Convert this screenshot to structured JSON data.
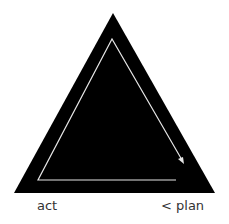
{
  "diagram": {
    "type": "cycle-triangle",
    "colors": {
      "background": "#ffffff",
      "triangle_fill": "#000000",
      "cycle_line": "#e6e6e6",
      "side_label": "#ffffff",
      "corner_label": "#333333"
    },
    "side_labels": {
      "left": "consequences",
      "right": "reappraisal"
    },
    "corner_labels": {
      "bottom_left": "act",
      "bottom_right": "< plan"
    }
  }
}
